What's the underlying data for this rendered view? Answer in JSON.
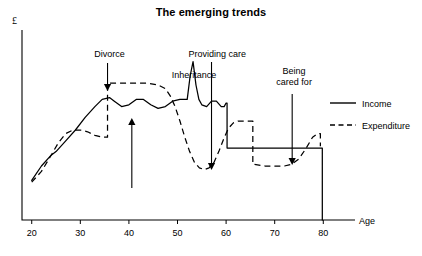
{
  "chart_data": {
    "type": "line",
    "title": "The emerging trends",
    "xlabel": "Age",
    "ylabel": "£",
    "xlim": [
      18,
      82
    ],
    "ylim": [
      0,
      100
    ],
    "xticks": [
      20,
      30,
      40,
      50,
      60,
      70,
      80
    ],
    "xticklabels": [
      "20",
      "30",
      "40",
      "50",
      "60",
      "70",
      "80"
    ],
    "yticks": [],
    "yticklabels": [],
    "grid": false,
    "legend_position": "right",
    "series": [
      {
        "name": "Income",
        "style": "solid",
        "points": [
          [
            20,
            22
          ],
          [
            22,
            30
          ],
          [
            24,
            36
          ],
          [
            25,
            38
          ],
          [
            27,
            44
          ],
          [
            29,
            50
          ],
          [
            31,
            57
          ],
          [
            33,
            63
          ],
          [
            34.5,
            67
          ],
          [
            36,
            68
          ],
          [
            37,
            66
          ],
          [
            38.5,
            63
          ],
          [
            40,
            64
          ],
          [
            41.5,
            67
          ],
          [
            43,
            67
          ],
          [
            44.5,
            64
          ],
          [
            46,
            62
          ],
          [
            47.5,
            63
          ],
          [
            49,
            66
          ],
          [
            50.5,
            67
          ],
          [
            51.5,
            67
          ],
          [
            52,
            67
          ],
          [
            52.6,
            80
          ],
          [
            53.2,
            88
          ],
          [
            53.8,
            75
          ],
          [
            54.4,
            67
          ],
          [
            55,
            64
          ],
          [
            56,
            63
          ],
          [
            57,
            66
          ],
          [
            58,
            66
          ],
          [
            59,
            63
          ],
          [
            59.6,
            63
          ],
          [
            60,
            65
          ],
          [
            60.2,
            65
          ],
          [
            60.2,
            40
          ],
          [
            66,
            40
          ],
          [
            72,
            40
          ],
          [
            78,
            40
          ],
          [
            79.8,
            40
          ],
          [
            79.8,
            0
          ]
        ]
      },
      {
        "name": "Expenditure",
        "style": "dashed",
        "points": [
          [
            20,
            21
          ],
          [
            22,
            27
          ],
          [
            24,
            36
          ],
          [
            25.5,
            43
          ],
          [
            27,
            48
          ],
          [
            28.5,
            50
          ],
          [
            30,
            50
          ],
          [
            31.5,
            49
          ],
          [
            33,
            47
          ],
          [
            34.5,
            46
          ],
          [
            35.6,
            46
          ],
          [
            35.6,
            76
          ],
          [
            38,
            76
          ],
          [
            41,
            76
          ],
          [
            44,
            76
          ],
          [
            46,
            75
          ],
          [
            47.5,
            73
          ],
          [
            48.5,
            69
          ],
          [
            49.5,
            63
          ],
          [
            50.5,
            55
          ],
          [
            51.5,
            46
          ],
          [
            52.5,
            38
          ],
          [
            53.5,
            32
          ],
          [
            54.5,
            29
          ],
          [
            55.5,
            28
          ],
          [
            56.5,
            29
          ],
          [
            57.5,
            32
          ],
          [
            58.5,
            38
          ],
          [
            59.5,
            45
          ],
          [
            60.5,
            51
          ],
          [
            61.5,
            54
          ],
          [
            62.5,
            55
          ],
          [
            64,
            55
          ],
          [
            65.5,
            55
          ],
          [
            65.5,
            31
          ],
          [
            68,
            30
          ],
          [
            70,
            30
          ],
          [
            72,
            30
          ],
          [
            73.5,
            31
          ],
          [
            75,
            34
          ],
          [
            76.5,
            40
          ],
          [
            77.8,
            46
          ],
          [
            78.8,
            48
          ],
          [
            79.4,
            48
          ],
          [
            79.4,
            41
          ]
        ]
      }
    ],
    "annotations": [
      {
        "id": "divorce",
        "label": "Divorce",
        "label_lines": [
          "Divorce"
        ],
        "label_x": 36,
        "label_y_px": 57,
        "arrow_x": 35.6,
        "arrow_y_top_px": 63,
        "arrow_y_tip_px": 91,
        "direction": "down"
      },
      {
        "id": "age-40-marker",
        "label": "",
        "label_lines": [],
        "label_x": 40.6,
        "label_y_px": 0,
        "arrow_x": 40.6,
        "arrow_y_top_px": 188,
        "arrow_y_tip_px": 118,
        "direction": "up"
      },
      {
        "id": "inheritance",
        "label": "Inheritance",
        "label_lines": [
          "Inheritance"
        ],
        "label_x": 53.4,
        "label_y_px": 78,
        "arrow_x": null,
        "arrow_y_top_px": null,
        "arrow_y_tip_px": null,
        "direction": "none"
      },
      {
        "id": "providing-care",
        "label": "Providing care",
        "label_lines": [
          "Providing care"
        ],
        "label_x": 58.2,
        "label_y_px": 57,
        "arrow_x": 57.0,
        "arrow_y_top_px": 62,
        "arrow_y_tip_px": 170,
        "direction": "down"
      },
      {
        "id": "being-cared-for",
        "label": "Being cared for",
        "label_lines": [
          "Being",
          "cared for"
        ],
        "label_x": 74.0,
        "label_y_px": 74,
        "arrow_x": 73.6,
        "arrow_y_top_px": 94,
        "arrow_y_tip_px": 165,
        "direction": "down"
      }
    ]
  },
  "legend": {
    "items": [
      {
        "label": "Income",
        "style": "solid"
      },
      {
        "label": "Expenditure",
        "style": "dashed"
      }
    ]
  }
}
